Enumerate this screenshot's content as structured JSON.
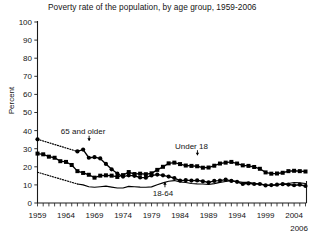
{
  "chart_data": {
    "type": "line",
    "title": "Poverty rate of the population, by age group, 1959-2006",
    "xlabel": "",
    "ylabel": "Percent",
    "ylim": [
      0,
      100
    ],
    "xlim": [
      1959,
      2006
    ],
    "yticks": [
      0,
      10,
      20,
      30,
      40,
      50,
      60,
      70,
      80,
      90,
      100
    ],
    "xticks": [
      1959,
      1964,
      1969,
      1974,
      1979,
      1984,
      1989,
      1994,
      1999,
      2004
    ],
    "xtick_labels": [
      "1959",
      "1964",
      "1969",
      "1974",
      "1979",
      "1984",
      "1989",
      "1994",
      "1999",
      "2004"
    ],
    "ytick_labels": [
      "0",
      "10",
      "20",
      "30",
      "40",
      "50",
      "60",
      "70",
      "80",
      "90",
      "100"
    ],
    "end_year_label": "2006",
    "grid": false,
    "legend": "inline-annotations",
    "minor_ticks": "every year on x-axis",
    "annotations": [
      {
        "text": "65 and older",
        "series": "65 and older",
        "x": 1967,
        "y": 38
      },
      {
        "text": "Under 18",
        "series": "Under 18",
        "x": 1986,
        "y": 30
      },
      {
        "text": "18-64",
        "series": "18-64",
        "x": 1981,
        "y": 4
      }
    ],
    "series": [
      {
        "name": "65 and older",
        "marker": "circle",
        "linestyle": "dotted-then-solid",
        "dotted_through": 1966,
        "x": [
          1959,
          1966,
          1967,
          1968,
          1969,
          1970,
          1971,
          1972,
          1973,
          1974,
          1975,
          1976,
          1977,
          1978,
          1979,
          1980,
          1981,
          1982,
          1983,
          1984,
          1985,
          1986,
          1987,
          1988,
          1989,
          1990,
          1991,
          1992,
          1993,
          1994,
          1995,
          1996,
          1997,
          1998,
          1999,
          2000,
          2001,
          2002,
          2003,
          2004,
          2005,
          2006
        ],
        "y": [
          35.2,
          28.5,
          29.5,
          25.0,
          25.3,
          24.6,
          21.6,
          18.6,
          16.3,
          14.6,
          15.3,
          15.0,
          14.1,
          14.0,
          15.2,
          15.7,
          15.3,
          14.6,
          13.8,
          12.4,
          12.6,
          12.4,
          12.5,
          12.0,
          11.4,
          12.2,
          12.4,
          12.9,
          12.2,
          11.7,
          10.5,
          10.8,
          10.5,
          10.5,
          9.7,
          9.9,
          10.1,
          10.4,
          10.2,
          9.8,
          10.1,
          9.4
        ]
      },
      {
        "name": "Under 18",
        "marker": "square",
        "linestyle": "solid",
        "x": [
          1959,
          1960,
          1961,
          1962,
          1963,
          1964,
          1965,
          1966,
          1967,
          1968,
          1969,
          1970,
          1971,
          1972,
          1973,
          1974,
          1975,
          1976,
          1977,
          1978,
          1979,
          1980,
          1981,
          1982,
          1983,
          1984,
          1985,
          1986,
          1987,
          1988,
          1989,
          1990,
          1991,
          1992,
          1993,
          1994,
          1995,
          1996,
          1997,
          1998,
          1999,
          2000,
          2001,
          2002,
          2003,
          2004,
          2005,
          2006
        ],
        "y": [
          27.3,
          26.9,
          25.6,
          25.0,
          23.1,
          22.7,
          21.0,
          17.6,
          16.6,
          15.6,
          14.0,
          15.1,
          15.3,
          15.1,
          14.4,
          15.4,
          17.1,
          16.0,
          16.2,
          15.9,
          16.4,
          18.3,
          20.0,
          21.9,
          22.3,
          21.5,
          20.7,
          20.5,
          20.3,
          19.5,
          19.6,
          20.6,
          21.8,
          22.3,
          22.7,
          21.8,
          20.8,
          20.5,
          19.9,
          18.9,
          16.9,
          16.2,
          16.3,
          16.7,
          17.6,
          17.8,
          17.6,
          17.4
        ]
      },
      {
        "name": "18-64",
        "marker": "none",
        "linestyle": "dotted-then-solid",
        "dotted_through": 1966,
        "x": [
          1959,
          1966,
          1967,
          1968,
          1969,
          1970,
          1971,
          1972,
          1973,
          1974,
          1975,
          1976,
          1977,
          1978,
          1979,
          1980,
          1981,
          1982,
          1983,
          1984,
          1985,
          1986,
          1987,
          1988,
          1989,
          1990,
          1991,
          1992,
          1993,
          1994,
          1995,
          1996,
          1997,
          1998,
          1999,
          2000,
          2001,
          2002,
          2003,
          2004,
          2005,
          2006
        ],
        "y": [
          17.0,
          10.5,
          10.0,
          9.0,
          8.7,
          9.0,
          9.3,
          8.8,
          8.3,
          8.3,
          9.2,
          9.0,
          8.8,
          8.7,
          8.9,
          10.1,
          11.1,
          12.0,
          12.4,
          11.7,
          11.3,
          10.8,
          10.6,
          10.5,
          10.2,
          10.7,
          11.4,
          11.9,
          12.4,
          11.9,
          11.4,
          11.4,
          10.9,
          10.5,
          10.0,
          9.6,
          10.1,
          10.6,
          10.8,
          11.3,
          11.1,
          10.8
        ]
      }
    ]
  },
  "caption": {
    "clipped_text": ""
  }
}
